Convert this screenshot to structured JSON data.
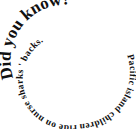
{
  "spiral_text": {
    "headline": "Did you know?",
    "body": "Pacific island children ride on nurse sharks ' backs."
  },
  "colors": {
    "background": "#ffffff",
    "text": "#111111"
  }
}
